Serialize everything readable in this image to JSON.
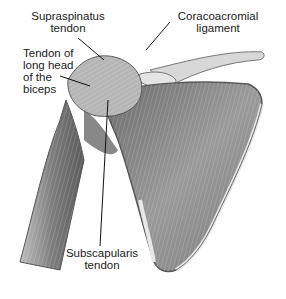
{
  "figure": {
    "labels": {
      "supraspinatus": {
        "line1": "Supraspinatus",
        "line2": "tendon"
      },
      "coracoacromial": {
        "line1": "Coracoacromial",
        "line2": "ligament"
      },
      "biceps": {
        "line1": "Tendon of",
        "line2": "long head",
        "line3": "of the",
        "line4": "biceps"
      },
      "subscapularis": {
        "line1": "Subscapularis",
        "line2": "tendon"
      }
    },
    "colors": {
      "background": "#ffffff",
      "muscle_dark": "#4a4a4a",
      "muscle_mid": "#8a8a8a",
      "muscle_light": "#c8c8c8",
      "bone": "#e6e6e6",
      "leader_line": "#111111",
      "text": "#1a1a1a"
    }
  }
}
